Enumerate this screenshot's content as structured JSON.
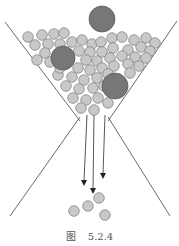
{
  "figure": {
    "caption_prefix": "图",
    "caption_number": "5.2.4",
    "colors": {
      "small_ball_fill": "#c8c8c8",
      "small_ball_stroke": "#7a7a7a",
      "large_ball_fill": "#777777",
      "large_ball_stroke": "#555555",
      "line": "#444444"
    },
    "large_balls": [
      {
        "cx": 102,
        "cy": 19,
        "r": 13
      },
      {
        "cx": 63,
        "cy": 58,
        "r": 12
      },
      {
        "cx": 115,
        "cy": 86,
        "r": 13
      }
    ],
    "small_balls_top": [
      [
        28,
        37
      ],
      [
        42,
        35
      ],
      [
        54,
        34
      ],
      [
        64,
        33
      ],
      [
        35,
        45
      ],
      [
        48,
        44
      ],
      [
        60,
        44
      ],
      [
        45,
        53
      ],
      [
        37,
        60
      ],
      [
        50,
        62
      ],
      [
        72,
        42
      ],
      [
        82,
        40
      ],
      [
        92,
        44
      ],
      [
        79,
        51
      ],
      [
        90,
        52
      ],
      [
        101,
        42
      ],
      [
        112,
        38
      ],
      [
        122,
        37
      ],
      [
        134,
        40
      ],
      [
        146,
        38
      ],
      [
        155,
        43
      ],
      [
        102,
        52
      ],
      [
        113,
        48
      ],
      [
        128,
        50
      ],
      [
        141,
        47
      ],
      [
        150,
        51
      ],
      [
        86,
        60
      ],
      [
        97,
        61
      ],
      [
        110,
        58
      ],
      [
        122,
        56
      ],
      [
        135,
        57
      ],
      [
        146,
        58
      ],
      [
        78,
        68
      ],
      [
        90,
        70
      ],
      [
        102,
        68
      ],
      [
        114,
        66
      ],
      [
        128,
        64
      ],
      [
        139,
        66
      ],
      [
        58,
        75
      ],
      [
        72,
        77
      ],
      [
        84,
        80
      ],
      [
        97,
        78
      ],
      [
        108,
        74
      ],
      [
        130,
        73
      ],
      [
        66,
        86
      ],
      [
        79,
        89
      ],
      [
        93,
        88
      ],
      [
        104,
        86
      ],
      [
        73,
        98
      ],
      [
        86,
        100
      ],
      [
        98,
        98
      ],
      [
        81,
        108
      ],
      [
        94,
        110
      ],
      [
        108,
        103
      ],
      [
        60,
        68
      ]
    ],
    "small_balls_bottom": [
      [
        74,
        211
      ],
      [
        88,
        206
      ],
      [
        99,
        198
      ],
      [
        105,
        215
      ]
    ],
    "arrows": [
      {
        "x1": 87,
        "y1": 115,
        "x2": 84,
        "y2": 185
      },
      {
        "x1": 94,
        "y1": 115,
        "x2": 93,
        "y2": 193
      },
      {
        "x1": 105,
        "y1": 115,
        "x2": 103,
        "y2": 178
      }
    ]
  }
}
